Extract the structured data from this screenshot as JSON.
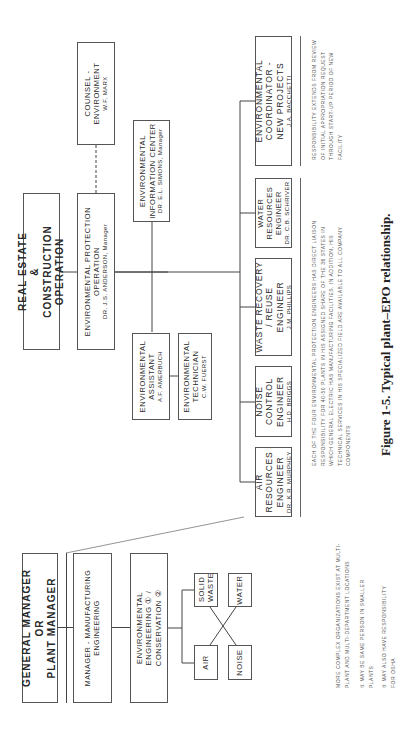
{
  "chart": {
    "caption": "Figure 1-5.  Typical plant–EPO relationship.",
    "plant_side": {
      "general_manager": {
        "line1": "GENERAL MANAGER",
        "line2": "OR",
        "line3": "PLANT MANAGER"
      },
      "manufacturing_engineering": {
        "label": "MANAGER - MANUFACTURING ENGINEERING"
      },
      "environmental_engineering": {
        "line1": "ENVIRONMENTAL",
        "line2": "ENGINEERING ① /",
        "line3": "CONSERVATION ②"
      },
      "areas": [
        {
          "label": "AIR"
        },
        {
          "label": "SOLID WASTE"
        },
        {
          "label": "NOISE"
        },
        {
          "label": "WATER"
        }
      ],
      "notes": {
        "complex": "MORE COMPLEX ORGANIZATIONS EXIST AT MULTI-PLANT AND MULTI-DEPARTMENT LOCATIONS",
        "note1": "① MAY BE SAME PERSON IN SMALLER PLANTS",
        "note2": "② MAY ALSO HAVE RESPONSIBILITY FOR OSHA"
      }
    },
    "corporate_side": {
      "real_estate": {
        "line1": "REAL ESTATE",
        "line2": "&",
        "line3": "CONSTRUCTION OPERATION"
      },
      "epo": {
        "line1": "ENVIRONMENTAL PROTECTION",
        "line2": "OPERATION",
        "name": "DR. J.S. ANDERSON, Manager"
      },
      "counsel": {
        "line1": "COUNSEL -",
        "line2": "ENVIRONMENT",
        "name": "W.F. MARX"
      },
      "info_center": {
        "line1": "ENVIRONMENTAL",
        "line2": "INFORMATION CENTER",
        "name": "DR. E.L. SIMONS, Manager"
      },
      "assistant": {
        "line1": "ENVIRONMENTAL",
        "line2": "ASSISTANT",
        "name": "A.F. AMERBUCH"
      },
      "technician": {
        "line1": "ENVIRONMENTAL",
        "line2": "TECHNICIAN",
        "name": "C.W. FUERST"
      },
      "engineers": [
        {
          "line1": "AIR RESOURCES",
          "line2": "ENGINEER",
          "name": "DR. K.R. MURPHEY"
        },
        {
          "line1": "NOISE CONTROL",
          "line2": "ENGINEER",
          "name": "H.D. BRIGGS"
        },
        {
          "line1": "WASTE RECOVERY / REUSE",
          "line2": "ENGINEER",
          "name": "J.M. PHILLIPS"
        },
        {
          "line1": "WATER RESOURCES",
          "line2": "ENGINEER",
          "name": "DR. C.B. SCHRIVER"
        },
        {
          "line1": "ENVIRONMENTAL COORDINATOR -",
          "line2": "NEW PROJECTS",
          "name": "J.A. BACCHETTI"
        }
      ],
      "notes": {
        "engineers": "EACH OF THE FOUR ENVIRONMENTAL PROTECTION ENGINEERS HAS DIRECT LIAISON RESPONSIBILITY FOR 40-50 PLANTS IN HIS ASSIGNED SHARE OF THE 36 STATES IN WHICH GENERAL ELECTRIC HAS MANUFACTURING FACILITIES. IN ADDITION, HIS TECHNICAL SERVICES IN HIS SPECIALIZED FIELD ARE AVAILABLE TO ALL COMPANY COMPONENTS",
        "coordinator": "RESPONSIBILITY EXTENDS FROM REVIEW OF INITIAL APPROPRIATION REQUEST THROUGH START-UP PERIOD OF NEW FACILITY"
      }
    }
  }
}
